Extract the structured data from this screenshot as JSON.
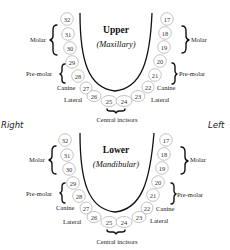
{
  "side_labels": {
    "right": "Right",
    "left": "Left"
  },
  "upper": {
    "title": "Upper",
    "subtitle": "(Maxillary)",
    "teeth": [
      "32",
      "31",
      "30",
      "29",
      "28",
      "27",
      "26",
      "25",
      "24",
      "23",
      "22",
      "21",
      "20",
      "19",
      "18",
      "17"
    ],
    "labels": {
      "molar_right": "Molar",
      "premolar_right": "Pre-molar",
      "canine_right": "Canine",
      "lateral_right": "Lateral",
      "central": "Central incisors",
      "lateral_left": "Lateral",
      "canine_left": "Canine",
      "premolar_left": "Pre-molar",
      "molar_left": "Molar"
    }
  },
  "lower": {
    "title": "Lower",
    "subtitle": "(Mandibular)",
    "teeth": [
      "32",
      "31",
      "30",
      "29",
      "28",
      "27",
      "26",
      "25",
      "24",
      "23",
      "22",
      "21",
      "20",
      "19",
      "18",
      "17"
    ],
    "labels": {
      "molar_right": "Molar",
      "premolar_right": "Pre-molar",
      "canine_right": "Canine",
      "lateral_right": "Lateral",
      "central": "Central incisors",
      "lateral_left": "Lateral",
      "canine_left": "Canine",
      "premolar_left": "Pre-molar",
      "molar_left": "Molar"
    }
  },
  "colors": {
    "ink": "#111111",
    "circle_stroke": "#9a9a9a",
    "background": "#ffffff"
  }
}
